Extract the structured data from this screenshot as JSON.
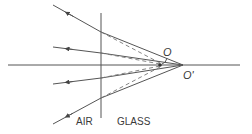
{
  "diagram": {
    "labels": {
      "object": "O",
      "image": "O'",
      "medium_left": "AIR",
      "medium_right": "GLASS"
    },
    "colors": {
      "line": "#555555",
      "dash": "#777777",
      "text": "#3a3a3a",
      "background": "#ffffff"
    },
    "geometry": {
      "axis": {
        "x1": 8,
        "y": 65,
        "x2": 240
      },
      "interface": {
        "x": 101,
        "y1": 13,
        "y2": 118
      },
      "O_prime": {
        "x": 183,
        "y": 65
      },
      "O": {
        "x": 160,
        "y": 65
      },
      "rays": [
        {
          "start": [
            53,
            5
          ],
          "hit": [
            101,
            32
          ]
        },
        {
          "start": [
            53,
            47
          ],
          "hit": [
            101,
            53
          ]
        },
        {
          "start": [
            53,
            84
          ],
          "hit": [
            101,
            78
          ]
        },
        {
          "start": [
            53,
            124
          ],
          "hit": [
            101,
            98
          ]
        }
      ]
    }
  }
}
